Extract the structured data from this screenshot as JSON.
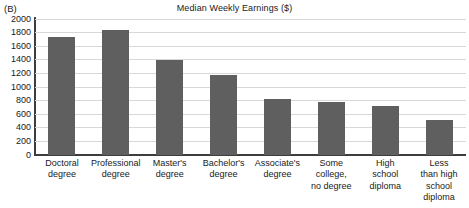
{
  "panel": {
    "label": "(B)"
  },
  "chart_data": {
    "type": "bar",
    "title": "Median Weekly Earnings ($)",
    "xlabel": "",
    "ylabel": "",
    "ylim": [
      0,
      2000
    ],
    "yticks": [
      0,
      200,
      400,
      600,
      800,
      1000,
      1200,
      1400,
      1600,
      1800,
      2000
    ],
    "ytick_labels": [
      "0",
      "200",
      "400",
      "600",
      "800",
      "1000",
      "1200",
      "1400",
      "1600",
      "1800",
      "2000"
    ],
    "grid": true,
    "legend": null,
    "bar_color": "#5f5f5f",
    "grid_color": "#d8d8d8",
    "axis_color": "#3d3d3d",
    "categories": [
      "Doctoral degree",
      "Professional degree",
      "Master's degree",
      "Bachelor's degree",
      "Associate's degree",
      "Some college, no degree",
      "High school diploma",
      "Less than high school diploma"
    ],
    "category_lines": [
      [
        "Doctoral",
        "degree"
      ],
      [
        "Professional",
        "degree"
      ],
      [
        "Master's",
        "degree"
      ],
      [
        "Bachelor's",
        "degree"
      ],
      [
        "Associate's",
        "degree"
      ],
      [
        "Some",
        "college,",
        "no degree"
      ],
      [
        "High",
        "school",
        "diploma"
      ],
      [
        "Less",
        "than high",
        "school",
        "diploma"
      ]
    ],
    "values": [
      1740,
      1840,
      1400,
      1180,
      830,
      780,
      720,
      520
    ]
  }
}
